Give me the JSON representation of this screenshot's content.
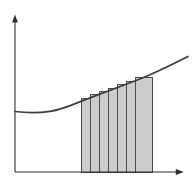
{
  "figure": {
    "kind": "riemann-sum-diagram",
    "colors": {
      "background": "#ffffff",
      "axis": "#2e2e2e",
      "curve": "#3e3e3e",
      "rect_fill": "#cccccc",
      "rect_stroke": "#4d4d4d"
    },
    "baseline_y": 172,
    "axes": {
      "y_line": "M 15 172 L 15 21",
      "x_line": "M 15 172 L 177.5 172",
      "y_arrowhead": "M 15 14.5 L 12.1 22.6 L 17.9 22.6 Z",
      "x_arrowhead": "M 183.8 172 L 175.8 169.1 L 175.8 174.9 Z"
    },
    "curve": {
      "path": "M 15 111.5 C 24 112.6 36 113.4 50 111.4 C 64 109.2 74 103.8 88 98.6 C 104 92.6 120 86.6 138 79.8 C 156 72.8 172 64.6 188 56.5",
      "start_point": {
        "x": 15,
        "y": 111.5
      },
      "end_point": {
        "x": 188,
        "y": 56.5
      }
    },
    "rectangles": {
      "count": 7,
      "bars": [
        {
          "x": 81,
          "width": 9,
          "top": 98
        },
        {
          "x": 90,
          "width": 9,
          "top": 94.8
        },
        {
          "x": 99,
          "width": 9,
          "top": 91.3
        },
        {
          "x": 108,
          "width": 9,
          "top": 88
        },
        {
          "x": 117,
          "width": 9,
          "top": 84.6
        },
        {
          "x": 126,
          "width": 9,
          "top": 81.2
        },
        {
          "x": 135,
          "width": 17.5,
          "top": 77.5
        }
      ]
    }
  }
}
